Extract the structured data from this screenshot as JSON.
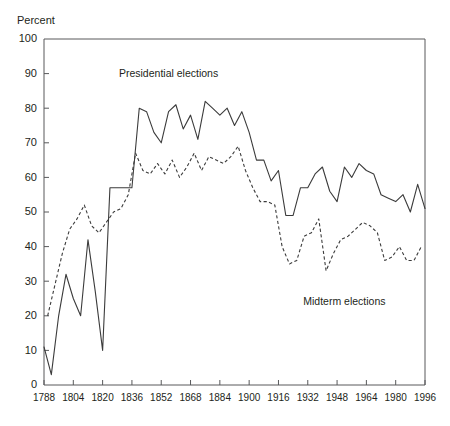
{
  "chart_data": {
    "type": "line",
    "title": "",
    "xlabel": "",
    "ylabel": "Percent",
    "ylim": [
      0,
      100
    ],
    "xlim": [
      1788,
      1996
    ],
    "ytick_labels": [
      "0",
      "10",
      "20",
      "30",
      "40",
      "50",
      "60",
      "70",
      "80",
      "90",
      "100"
    ],
    "yticks": [
      0,
      10,
      20,
      30,
      40,
      50,
      60,
      70,
      80,
      90,
      100
    ],
    "xtick_labels": [
      "1788",
      "1804",
      "1820",
      "1836",
      "1852",
      "1868",
      "1884",
      "1900",
      "1916",
      "1932",
      "1948",
      "1964",
      "1980",
      "1996"
    ],
    "xticks": [
      1788,
      1804,
      1820,
      1836,
      1852,
      1868,
      1884,
      1900,
      1916,
      1932,
      1948,
      1964,
      1980,
      1996
    ],
    "grid": false,
    "legend_position": "inline-annotation",
    "annotations": [
      {
        "text": "Presidential elections",
        "x": 1856,
        "y": 89
      },
      {
        "text": "Midterm elections",
        "x": 1952,
        "y": 23
      }
    ],
    "series": [
      {
        "name": "Presidential elections",
        "style": "solid",
        "color": "#3b3b3b",
        "x": [
          1788,
          1792,
          1796,
          1800,
          1804,
          1808,
          1812,
          1816,
          1820,
          1824,
          1828,
          1832,
          1836,
          1840,
          1844,
          1848,
          1852,
          1856,
          1860,
          1864,
          1868,
          1872,
          1876,
          1880,
          1884,
          1888,
          1892,
          1896,
          1900,
          1904,
          1908,
          1912,
          1916,
          1920,
          1924,
          1928,
          1932,
          1936,
          1940,
          1944,
          1948,
          1952,
          1956,
          1960,
          1964,
          1968,
          1972,
          1976,
          1980,
          1984,
          1988,
          1992,
          1996
        ],
        "values": [
          11,
          3,
          20,
          32,
          25,
          20,
          42,
          27,
          10,
          57,
          57,
          57,
          57,
          80,
          79,
          73,
          70,
          79,
          81,
          74,
          78,
          71,
          82,
          80,
          78,
          80,
          75,
          79,
          73,
          65,
          65,
          59,
          62,
          49,
          49,
          57,
          57,
          61,
          63,
          56,
          53,
          63,
          60,
          64,
          62,
          61,
          55,
          54,
          53,
          55,
          50,
          58,
          51
        ]
      },
      {
        "name": "Midterm elections",
        "style": "dashed",
        "color": "#3b3b3b",
        "x": [
          1790,
          1794,
          1798,
          1802,
          1806,
          1810,
          1814,
          1818,
          1822,
          1826,
          1830,
          1834,
          1838,
          1842,
          1846,
          1850,
          1854,
          1858,
          1862,
          1866,
          1870,
          1874,
          1878,
          1882,
          1886,
          1890,
          1894,
          1898,
          1902,
          1906,
          1910,
          1914,
          1918,
          1922,
          1926,
          1930,
          1934,
          1938,
          1942,
          1946,
          1950,
          1954,
          1958,
          1962,
          1966,
          1970,
          1974,
          1978,
          1982,
          1986,
          1990,
          1994
        ],
        "values": [
          20,
          29,
          38,
          45,
          48,
          52,
          46,
          44,
          47,
          50,
          51,
          55,
          67,
          62,
          61,
          64,
          61,
          65,
          60,
          63,
          67,
          62,
          66,
          65,
          64,
          66,
          69,
          62,
          57,
          53,
          53,
          52,
          40,
          35,
          36,
          43,
          44,
          48,
          33,
          38,
          42,
          43,
          45,
          47,
          46,
          44,
          36,
          37,
          40,
          36,
          36,
          40
        ]
      }
    ]
  },
  "axis": {
    "y_title": "Percent"
  }
}
